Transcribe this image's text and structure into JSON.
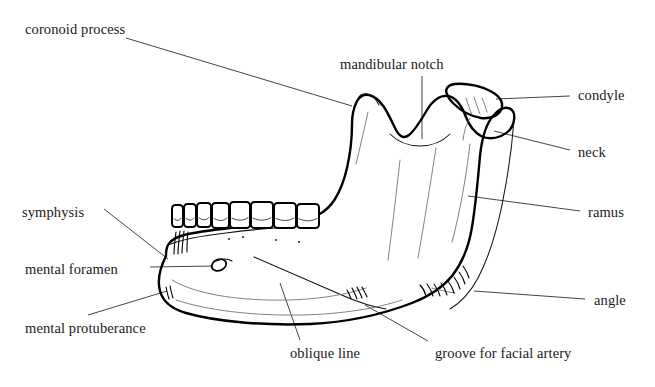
{
  "figure": {
    "view": "lateral",
    "background_color": "#ffffff",
    "line_color": "#000000",
    "label_color": "#1a1a1a",
    "leader_color": "#3a3a3a"
  },
  "labels": [
    {
      "id": "coronoid-process",
      "text": "coronoid process",
      "x": 25,
      "y": 22,
      "align": "left"
    },
    {
      "id": "mandibular-notch",
      "text": "mandibular notch",
      "x": 340,
      "y": 57,
      "align": "left"
    },
    {
      "id": "condyle",
      "text": "condyle",
      "x": 578,
      "y": 88,
      "align": "left"
    },
    {
      "id": "neck",
      "text": "neck",
      "x": 578,
      "y": 145,
      "align": "left"
    },
    {
      "id": "ramus",
      "text": "ramus",
      "x": 588,
      "y": 205,
      "align": "left"
    },
    {
      "id": "angle",
      "text": "angle",
      "x": 594,
      "y": 293,
      "align": "left"
    },
    {
      "id": "symphysis",
      "text": "symphysis",
      "x": 22,
      "y": 205,
      "align": "left"
    },
    {
      "id": "mental-foramen",
      "text": "mental foramen",
      "x": 25,
      "y": 262,
      "align": "left"
    },
    {
      "id": "mental-protuberance",
      "text": "mental protuberance",
      "x": 25,
      "y": 321,
      "align": "left"
    },
    {
      "id": "oblique-line",
      "text": "oblique line",
      "x": 290,
      "y": 346,
      "align": "left"
    },
    {
      "id": "groove-for-facial-artery",
      "text": "groove for facial artery",
      "x": 435,
      "y": 346,
      "align": "left"
    }
  ],
  "leader_lines": [
    {
      "id": "leader-coronoid-process",
      "path": "M 126 38 L 352 106"
    },
    {
      "id": "leader-mandibular-notch",
      "path": "M 422 76 L 422 139"
    },
    {
      "id": "leader-condyle",
      "path": "M 570 96 L 496 99"
    },
    {
      "id": "leader-neck",
      "path": "M 570 150 L 494 131"
    },
    {
      "id": "leader-ramus",
      "path": "M 580 211 L 468 196"
    },
    {
      "id": "leader-angle",
      "path": "M 585 299 L 474 291"
    },
    {
      "id": "leader-symphysis",
      "path": "M 104 209 L 168 259"
    },
    {
      "id": "leader-mental-foramen",
      "path": "M 150 267 L 214 266"
    },
    {
      "id": "leader-mental-protuberance",
      "path": "M 88 315 L 167 291"
    },
    {
      "id": "leader-oblique-line",
      "path": "M 300 340 L 280 283"
    },
    {
      "id": "leader-groove-for-facial-artery",
      "path": "M 428 341 L 365 305"
    }
  ],
  "anatomy_paths": {
    "body_and_ramus_outline": "M 166 256 C 160 268 157 280 160 291 C 163 302 172 309 186 313 C 214 321 262 326 310 324 C 352 322 386 313 412 303 C 430 296 443 287 452 276 C 463 262 469 246 472 227 C 476 203 478 178 480 156 C 482 137 486 124 493 116 C 498 110 504 107 508 108 C 513 109 515 114 514 120 C 513 127 508 133 501 136 C 494 139 487 139 481 136 C 474 132 469 125 466 117 C 461 104 455 97 448 96 C 440 95 433 100 427 110 C 420 122 414 131 409 135 C 404 139 400 137 396 130 C 391 120 388 113 384 107 C 379 100 374 96 369 95 C 364 94 360 96 357 101 C 354 107 352 115 352 124 C 352 140 350 155 347 168 C 344 181 340 191 335 199 C 330 207 324 212 318 215 C 310 219 300 221 288 222 C 268 224 248 226 230 228 C 212 230 196 232 184 235 C 176 237 171 240 168 245 C 166 249 166 252 166 256 Z",
    "ramus_posterior_border": "M 514 120 C 512 146 508 176 502 205 C 496 234 488 259 478 278 C 470 293 460 303 450 309",
    "condyle_head": "M 448 96 C 444 90 447 85 455 84 C 467 83 482 86 492 92 C 501 97 504 104 501 110 C 498 116 490 119 481 118 C 470 116 460 110 454 104 C 450 100 448 98 448 96 Z",
    "coronoid_tip": "M 357 101 C 358 96 362 93 367 94 C 372 95 376 99 379 105",
    "alveolar_margin": "M 168 245 C 180 240 200 236 226 233 C 256 229 286 227 312 226",
    "mylohyoid_faint": "M 172 280 C 192 292 226 299 268 300 C 308 301 342 296 366 288",
    "oblique_line_path": "M 254 257 C 284 270 314 283 344 296 C 360 303 374 307 386 309",
    "ramus_shade_1": "M 470 144 C 466 178 460 212 452 242",
    "ramus_shade_2": "M 436 148 C 430 186 424 224 418 258",
    "ramus_shade_3": "M 400 160 C 396 196 392 230 388 260",
    "coronoid_shade": "M 368 112 C 364 130 360 148 356 164",
    "notch_inner": "M 390 134 C 398 142 408 146 420 146 C 432 146 442 142 450 134",
    "neck_shade": "M 470 118 C 466 124 464 132 463 140",
    "condyle_inner_1": "M 466 98 C 468 104 470 110 472 115",
    "condyle_inner_2": "M 474 97 C 476 103 478 109 480 114",
    "condyle_inner_3": "M 482 98 C 484 103 486 108 487 112",
    "gonial_tubercle": "M 432 288 C 440 290 448 292 455 293",
    "body_lower_faint": "M 176 300 C 206 310 252 316 302 315 C 344 314 378 308 402 300"
  },
  "teeth": [
    {
      "id": "tooth-1",
      "x": 172,
      "y": 205,
      "w": 11,
      "h": 22,
      "type": "incisor"
    },
    {
      "id": "tooth-2",
      "x": 184,
      "y": 204,
      "w": 12,
      "h": 23,
      "type": "incisor"
    },
    {
      "id": "tooth-3",
      "x": 197,
      "y": 203,
      "w": 14,
      "h": 24,
      "type": "canine"
    },
    {
      "id": "tooth-4",
      "x": 212,
      "y": 203,
      "w": 17,
      "h": 25,
      "type": "premolar"
    },
    {
      "id": "tooth-5",
      "x": 230,
      "y": 202,
      "w": 20,
      "h": 26,
      "type": "premolar"
    },
    {
      "id": "tooth-6",
      "x": 251,
      "y": 202,
      "w": 22,
      "h": 26,
      "type": "molar"
    },
    {
      "id": "tooth-7",
      "x": 274,
      "y": 203,
      "w": 22,
      "h": 25,
      "type": "molar"
    },
    {
      "id": "tooth-8",
      "x": 297,
      "y": 204,
      "w": 22,
      "h": 24,
      "type": "molar"
    }
  ],
  "features": {
    "mental_foramen": {
      "cx": 219,
      "cy": 265,
      "rx": 7.5,
      "ry": 5.5,
      "rotation": -22
    },
    "symphysis_ridges": [
      "M 176 232 C 175 240 174 248 174 254",
      "M 180 231 C 179 240 178 248 178 254",
      "M 184 231 C 183 240 182 247 182 253",
      "M 188 232 C 187 240 187 246 187 252"
    ],
    "masseter_hatching": [
      "M 420 285 C 423 288 425 292 426 296",
      "M 427 284 C 430 288 432 292 433 296",
      "M 434 284 C 437 288 439 292 440 296",
      "M 441 283 C 444 287 446 291 447 295",
      "M 448 281 C 451 285 453 289 454 293",
      "M 454 277 C 457 281 459 285 460 289",
      "M 459 272 C 462 276 464 280 465 284",
      "M 463 266 C 466 270 468 274 469 278"
    ],
    "digastric_marks": [
      "M 352 288 C 354 292 356 296 357 299",
      "M 357 287 C 359 291 361 295 362 298",
      "M 362 287 C 364 291 366 294 367 297",
      "M 347 290 C 349 293 350 296 351 299"
    ],
    "alveolar_dots": [
      {
        "x": 229,
        "y": 239
      },
      {
        "x": 243,
        "y": 237
      },
      {
        "x": 276,
        "y": 240
      },
      {
        "x": 299,
        "y": 242
      }
    ],
    "mental_tubercle_marks": [
      "M 166 287 C 167 292 168 296 169 299",
      "M 170 286 C 171 291 172 295 173 298"
    ]
  }
}
